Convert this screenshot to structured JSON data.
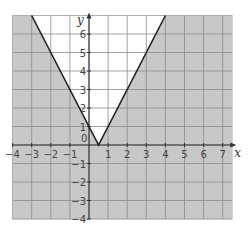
{
  "chart_data": {
    "type": "line",
    "title": "",
    "xlabel": "x",
    "ylabel": "y",
    "xlim": [
      -4,
      7.5
    ],
    "ylim": [
      -4,
      7
    ],
    "grid": true,
    "x_ticks": [
      -4,
      -3,
      -2,
      -1,
      1,
      2,
      3,
      4,
      5,
      6,
      7
    ],
    "x_tick_labels": [
      "−4",
      "−3",
      "−2",
      "−1",
      "1",
      "2",
      "3",
      "4",
      "5",
      "6",
      "7"
    ],
    "y_ticks": [
      -4,
      -3,
      -2,
      -1,
      1,
      2,
      3,
      4,
      5,
      6
    ],
    "y_tick_labels": [
      "−4",
      "−3",
      "−2",
      "−1",
      "1",
      "2",
      "3",
      "4",
      "5",
      "6"
    ],
    "origin_label": "0",
    "series": [
      {
        "name": "y = |2x − 1|",
        "x": [
          -3,
          0.5,
          4
        ],
        "y": [
          7,
          0,
          7
        ]
      }
    ],
    "shading": {
      "description": "Region outside the V (y < |2x - 1|) is shaded grey; region inside the V (y >= |2x - 1|) is left unshaded",
      "shaded_color": "#c8c8c8",
      "unshaded_color": "#ffffff"
    }
  },
  "colors": {
    "grid_line": "#8a8a8a",
    "axis": "#333333",
    "curve": "#222222",
    "shade": "#c8c8c8"
  }
}
